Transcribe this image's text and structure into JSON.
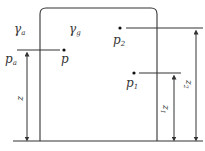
{
  "diagram": {
    "type": "hydrostatic pressure in tank",
    "colors": {
      "stroke": "#333333",
      "background": "#ffffff"
    },
    "regions": {
      "outside_label": "γ",
      "outside_sub": "a",
      "inside_label": "γ",
      "inside_sub": "g"
    },
    "points": [
      {
        "id": "p",
        "label": "p",
        "sub": ""
      },
      {
        "id": "p1",
        "label": "p",
        "sub": "1"
      },
      {
        "id": "p2",
        "label": "p",
        "sub": "2"
      }
    ],
    "pressure_labels": {
      "ambient_label": "p",
      "ambient_sub": "a"
    },
    "heights": [
      {
        "id": "z",
        "label": "z",
        "sub": ""
      },
      {
        "id": "z1",
        "label": "z",
        "sub": "1"
      },
      {
        "id": "z2",
        "label": "z",
        "sub": "2"
      }
    ]
  }
}
